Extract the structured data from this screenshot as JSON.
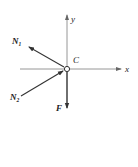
{
  "diagram": {
    "type": "free-body-diagram",
    "point_label": "C",
    "axes": {
      "x_label": "x",
      "y_label": "y"
    },
    "forces": [
      {
        "name": "N1",
        "label_main": "N",
        "label_sub": "1",
        "direction": "up-left"
      },
      {
        "name": "N2",
        "label_main": "N",
        "label_sub": "2",
        "direction": "toward C from lower-left"
      },
      {
        "name": "F",
        "label_main": "F",
        "label_sub": "",
        "direction": "down"
      }
    ],
    "colors": {
      "line": "#333333",
      "axis": "#888888",
      "background": "#ffffff"
    }
  }
}
